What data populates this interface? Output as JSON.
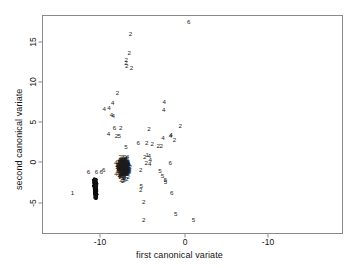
{
  "figure": {
    "background_color": "#ffffff",
    "frame_color": "#8a8a8a",
    "point_color": "#1b1b1b"
  },
  "axes": {
    "xlabel": "first canonical variate",
    "ylabel": "second canonical variate",
    "x_ticks": [
      "-10",
      "0",
      "-10"
    ],
    "y_ticks": [
      "15",
      "10",
      "5",
      "0",
      "-5"
    ]
  },
  "chart_data": {
    "type": "scatter",
    "title": "",
    "xlabel": "first canonical variate",
    "ylabel": "second canonical variate",
    "xlim": [
      -16.5,
      5.5
    ],
    "ylim": [
      -7.8,
      17.8
    ],
    "xtick_values": [
      -10,
      0,
      -10
    ],
    "xtick_labels": [
      "-10",
      "0",
      "-10"
    ],
    "ytick_values": [
      15,
      10,
      5,
      0,
      -5
    ],
    "ytick_labels": [
      "15",
      "10",
      "5",
      "0",
      "-5"
    ],
    "grid": false,
    "legend": null,
    "marker_style": "group-digit-labels",
    "groups": [
      "1",
      "2",
      "4",
      "5",
      "6"
    ],
    "note": "Points are plotted as the group index digit. A dense overplotted cluster of group-1/2/4 points sits near (-7.3, -0.8) and a second dark overplotted blob of group-6 points sits near (-10.6, -3.1) in axis units.",
    "points": [
      {
        "x": 0.45,
        "y": 17.5,
        "label": "6"
      },
      {
        "x": -6.4,
        "y": 15.9,
        "label": "2"
      },
      {
        "x": -6.55,
        "y": 13.6,
        "label": "2"
      },
      {
        "x": -6.9,
        "y": 12.7,
        "label": "2"
      },
      {
        "x": -6.95,
        "y": 12.35,
        "label": "2"
      },
      {
        "x": -6.85,
        "y": 11.9,
        "label": "2"
      },
      {
        "x": -6.3,
        "y": 11.7,
        "label": "2"
      },
      {
        "x": -7.95,
        "y": 8.6,
        "label": "2"
      },
      {
        "x": -8.5,
        "y": 7.35,
        "label": "4"
      },
      {
        "x": -8.95,
        "y": 6.75,
        "label": "4"
      },
      {
        "x": -9.5,
        "y": 6.6,
        "label": "4"
      },
      {
        "x": -8.65,
        "y": 5.85,
        "label": "4"
      },
      {
        "x": -8.45,
        "y": 5.75,
        "label": "4"
      },
      {
        "x": -2.45,
        "y": 7.45,
        "label": "4"
      },
      {
        "x": -2.5,
        "y": 6.4,
        "label": "4"
      },
      {
        "x": -4.25,
        "y": 4.1,
        "label": "2"
      },
      {
        "x": -0.55,
        "y": 4.5,
        "label": "2"
      },
      {
        "x": -8.3,
        "y": 4.15,
        "label": "6"
      },
      {
        "x": -7.55,
        "y": 4.15,
        "label": "2"
      },
      {
        "x": -9.0,
        "y": 3.4,
        "label": "4"
      },
      {
        "x": -8.05,
        "y": 3.2,
        "label": "2"
      },
      {
        "x": -7.75,
        "y": 3.25,
        "label": "5"
      },
      {
        "x": -1.65,
        "y": 3.35,
        "label": "4"
      },
      {
        "x": -1.7,
        "y": 3.15,
        "label": "4"
      },
      {
        "x": -2.6,
        "y": 2.95,
        "label": "4"
      },
      {
        "x": -1.25,
        "y": 2.65,
        "label": "2"
      },
      {
        "x": -5.5,
        "y": 2.3,
        "label": "6"
      },
      {
        "x": -4.5,
        "y": 2.3,
        "label": "2"
      },
      {
        "x": -3.85,
        "y": 2.25,
        "label": "2"
      },
      {
        "x": -3.15,
        "y": 2.0,
        "label": "2"
      },
      {
        "x": -2.8,
        "y": 1.95,
        "label": "2"
      },
      {
        "x": -6.95,
        "y": 1.8,
        "label": "5"
      },
      {
        "x": -4.45,
        "y": 0.85,
        "label": "1"
      },
      {
        "x": -4.2,
        "y": 0.7,
        "label": "4"
      },
      {
        "x": -4.75,
        "y": 0.55,
        "label": "2"
      },
      {
        "x": -4.1,
        "y": 0.25,
        "label": "4"
      },
      {
        "x": -4.55,
        "y": -0.2,
        "label": "2"
      },
      {
        "x": -4.15,
        "y": -0.25,
        "label": "4"
      },
      {
        "x": -1.75,
        "y": -0.15,
        "label": "6"
      },
      {
        "x": -7.5,
        "y": -0.9,
        "label": "5"
      },
      {
        "x": -5.2,
        "y": -1.0,
        "label": "2"
      },
      {
        "x": -10.4,
        "y": -1.3,
        "label": "6"
      },
      {
        "x": -9.85,
        "y": -1.3,
        "label": "6"
      },
      {
        "x": -2.95,
        "y": -1.2,
        "label": "5"
      },
      {
        "x": -2.65,
        "y": -1.75,
        "label": "5"
      },
      {
        "x": -2.3,
        "y": -2.25,
        "label": "5"
      },
      {
        "x": -2.3,
        "y": -2.5,
        "label": "5"
      },
      {
        "x": -1.55,
        "y": -3.9,
        "label": "6"
      },
      {
        "x": -5.15,
        "y": -3.1,
        "label": "5"
      },
      {
        "x": -5.2,
        "y": -3.55,
        "label": "2"
      },
      {
        "x": -9.55,
        "y": -1.0,
        "label": "6"
      },
      {
        "x": -11.35,
        "y": -1.35,
        "label": "6"
      },
      {
        "x": -13.25,
        "y": -3.9,
        "label": "1"
      },
      {
        "x": -4.85,
        "y": -5.05,
        "label": "2"
      },
      {
        "x": -4.85,
        "y": -7.3,
        "label": "2"
      },
      {
        "x": -1.1,
        "y": -6.5,
        "label": "5"
      },
      {
        "x": 1.0,
        "y": -7.35,
        "label": "5"
      },
      {
        "x": -10.6,
        "y": -2.25,
        "label": "6"
      },
      {
        "x": -10.45,
        "y": -3.05,
        "label": "6"
      },
      {
        "x": -10.5,
        "y": -4.55,
        "label": "6"
      }
    ]
  }
}
